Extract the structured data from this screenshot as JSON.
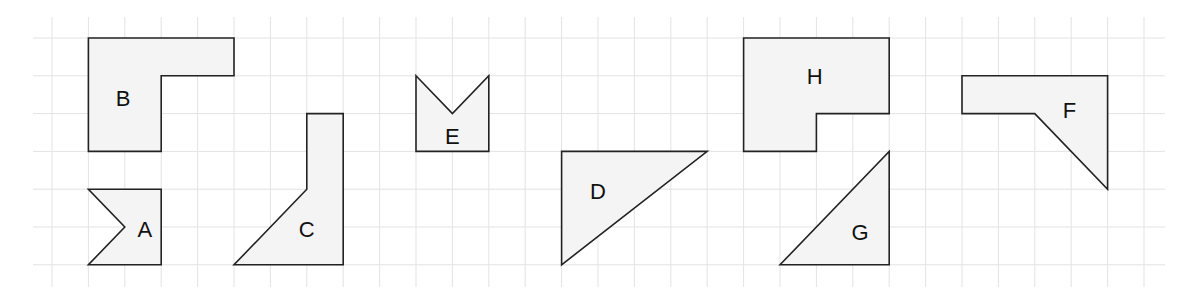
{
  "grid": {
    "origin_x": 52,
    "origin_y": 38,
    "cell_w": 36.4,
    "cell_h": 37.8,
    "x_start": 33,
    "x_end": 1165,
    "y_start": 17,
    "y_end": 287,
    "cols": 31,
    "rows": 7,
    "line_color": "#e3e3e3"
  },
  "shape_style": {
    "fill": "#f4f4f4",
    "stroke": "#222222"
  },
  "shapes": [
    {
      "label": "A",
      "points": [
        [
          1,
          4
        ],
        [
          3,
          4
        ],
        [
          3,
          6
        ],
        [
          1,
          6
        ],
        [
          2,
          5
        ]
      ],
      "label_pos": [
        2.55,
        5.1
      ]
    },
    {
      "label": "B",
      "points": [
        [
          1,
          0
        ],
        [
          5,
          0
        ],
        [
          5,
          1
        ],
        [
          3,
          1
        ],
        [
          3,
          3
        ],
        [
          1,
          3
        ]
      ],
      "label_pos": [
        1.95,
        1.65
      ]
    },
    {
      "label": "C",
      "points": [
        [
          7,
          2
        ],
        [
          8,
          2
        ],
        [
          8,
          6
        ],
        [
          5,
          6
        ],
        [
          7,
          4
        ]
      ],
      "label_pos": [
        7.0,
        5.1
      ]
    },
    {
      "label": "D",
      "points": [
        [
          14,
          3
        ],
        [
          18,
          3
        ],
        [
          14,
          6
        ]
      ],
      "label_pos": [
        15.0,
        4.1
      ]
    },
    {
      "label": "E",
      "points": [
        [
          10,
          1
        ],
        [
          11,
          2
        ],
        [
          12,
          1
        ],
        [
          12,
          3
        ],
        [
          10,
          3
        ]
      ],
      "label_pos": [
        11.0,
        2.65
      ]
    },
    {
      "label": "F",
      "points": [
        [
          25,
          1
        ],
        [
          29,
          1
        ],
        [
          29,
          4
        ],
        [
          27,
          2
        ],
        [
          25,
          2
        ]
      ],
      "label_pos": [
        27.95,
        1.95
      ]
    },
    {
      "label": "G",
      "points": [
        [
          20,
          6
        ],
        [
          23,
          3
        ],
        [
          23,
          6
        ]
      ],
      "label_pos": [
        22.2,
        5.2
      ]
    },
    {
      "label": "H",
      "points": [
        [
          19,
          0
        ],
        [
          23,
          0
        ],
        [
          23,
          2
        ],
        [
          21,
          2
        ],
        [
          21,
          3
        ],
        [
          19,
          3
        ]
      ],
      "label_pos": [
        20.95,
        1.05
      ]
    }
  ]
}
